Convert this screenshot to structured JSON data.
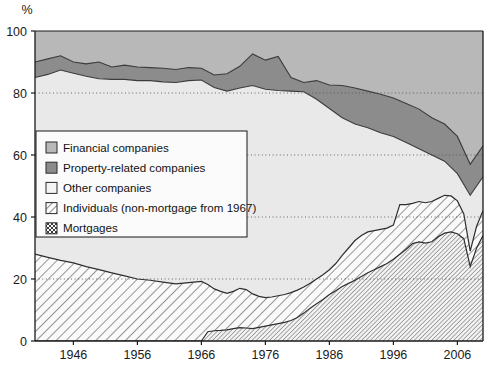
{
  "chart_data": {
    "type": "area",
    "stacked": true,
    "title": "",
    "subtitle": "",
    "xlabel": "",
    "ylabel": "%",
    "ylim": [
      0,
      100
    ],
    "xlim": [
      1940,
      2010
    ],
    "yticks": [
      0,
      20,
      40,
      60,
      80,
      100
    ],
    "ytick_labels": [
      "0",
      "20",
      "40",
      "60",
      "80",
      "100"
    ],
    "xticks": [
      1946,
      1956,
      1966,
      1976,
      1986,
      1996,
      2006
    ],
    "xtick_labels": [
      "1946",
      "1956",
      "1966",
      "1976",
      "1986",
      "1996",
      "2006"
    ],
    "grid": "horizontal dotted at 20, 40, 60, 80",
    "legend_position": "inner left-middle",
    "axis_note": "values are shares of total lending, summing to 100%",
    "series": [
      {
        "name": "Mortgages",
        "swatch": "diagonal-hatch-dense",
        "color": "#f2f2f2",
        "order": 1,
        "x": [
          1940,
          1942,
          1944,
          1946,
          1948,
          1950,
          1952,
          1954,
          1956,
          1958,
          1960,
          1962,
          1964,
          1966,
          1967,
          1968,
          1969,
          1970,
          1971,
          1972,
          1973,
          1974,
          1975,
          1976,
          1977,
          1978,
          1979,
          1980,
          1981,
          1982,
          1983,
          1984,
          1985,
          1986,
          1987,
          1988,
          1989,
          1990,
          1991,
          1992,
          1993,
          1994,
          1995,
          1996,
          1997,
          1998,
          1999,
          2000,
          2001,
          2002,
          2003,
          2004,
          2005,
          2006,
          2007,
          2008,
          2009,
          2010
        ],
        "values": [
          0,
          0,
          0,
          0,
          0,
          0,
          0,
          0,
          0,
          0,
          0,
          0,
          0,
          0,
          3.0,
          3.3,
          3.4,
          3.6,
          4.0,
          4.3,
          4.2,
          4.0,
          4.4,
          4.8,
          5.2,
          5.6,
          6.0,
          6.6,
          7.6,
          9.0,
          10.6,
          12.0,
          13.4,
          15.0,
          16.2,
          17.6,
          18.6,
          19.6,
          20.8,
          22.0,
          23.0,
          24.0,
          25.0,
          26.4,
          28.0,
          29.6,
          31.4,
          32.0,
          31.6,
          32.0,
          33.6,
          34.8,
          35.2,
          34.6,
          33.0,
          24.0,
          30.0,
          34.0
        ]
      },
      {
        "name": "Individuals (non-mortgage from 1967)",
        "swatch": "diagonal-hatch",
        "color": "#fafafa",
        "order": 2,
        "x": [
          1940,
          1942,
          1944,
          1946,
          1948,
          1950,
          1952,
          1954,
          1956,
          1958,
          1960,
          1962,
          1964,
          1966,
          1967,
          1968,
          1969,
          1970,
          1971,
          1972,
          1973,
          1974,
          1975,
          1976,
          1977,
          1978,
          1979,
          1980,
          1981,
          1982,
          1983,
          1984,
          1985,
          1986,
          1987,
          1988,
          1989,
          1990,
          1991,
          1992,
          1993,
          1994,
          1995,
          1996,
          1997,
          1998,
          1999,
          2000,
          2001,
          2002,
          2003,
          2004,
          2005,
          2006,
          2007,
          2008,
          2009,
          2010
        ],
        "values": [
          28.0,
          27.0,
          26.0,
          25.2,
          24.0,
          23.0,
          22.0,
          21.0,
          20.0,
          19.6,
          19.0,
          18.4,
          18.8,
          19.2,
          18.2,
          16.8,
          16.0,
          15.4,
          16.0,
          17.0,
          16.6,
          15.2,
          14.4,
          14.0,
          14.2,
          14.6,
          15.0,
          15.6,
          16.4,
          17.4,
          18.6,
          20.0,
          21.4,
          23.0,
          25.0,
          27.6,
          30.0,
          32.4,
          34.0,
          35.2,
          35.6,
          36.0,
          36.4,
          37.4,
          44.0,
          44.0,
          44.4,
          45.0,
          44.6,
          45.0,
          46.0,
          47.0,
          46.8,
          45.2,
          41.0,
          29.0,
          37.0,
          42.0
        ]
      },
      {
        "name": "Other companies",
        "swatch": "white",
        "color": "#e9e9e9",
        "order": 3,
        "x": [
          1940,
          1942,
          1944,
          1946,
          1948,
          1950,
          1952,
          1954,
          1956,
          1958,
          1960,
          1962,
          1964,
          1966,
          1968,
          1970,
          1972,
          1974,
          1976,
          1978,
          1980,
          1982,
          1984,
          1986,
          1988,
          1990,
          1992,
          1994,
          1996,
          1998,
          2000,
          2002,
          2004,
          2006,
          2008,
          2010
        ],
        "values": [
          85.0,
          86.0,
          87.4,
          86.4,
          85.4,
          84.6,
          84.4,
          84.4,
          84.0,
          84.0,
          83.6,
          83.4,
          84.0,
          84.2,
          81.8,
          80.6,
          81.6,
          82.4,
          81.2,
          80.8,
          80.6,
          80.4,
          78.0,
          75.0,
          72.0,
          70.0,
          68.8,
          67.2,
          66.0,
          64.0,
          62.0,
          60.0,
          58.0,
          54.0,
          47.0,
          53.0
        ]
      },
      {
        "name": "Property-related companies",
        "swatch": "dark-gray",
        "color": "#8c8c8c",
        "order": 4,
        "x": [
          1940,
          1942,
          1944,
          1946,
          1948,
          1950,
          1952,
          1954,
          1956,
          1958,
          1960,
          1962,
          1964,
          1966,
          1968,
          1970,
          1972,
          1974,
          1976,
          1978,
          1980,
          1982,
          1984,
          1986,
          1988,
          1990,
          1992,
          1994,
          1996,
          1998,
          2000,
          2002,
          2004,
          2006,
          2008,
          2010
        ],
        "values": [
          90.0,
          91.0,
          92.0,
          90.0,
          89.4,
          90.0,
          88.4,
          89.0,
          88.4,
          88.2,
          88.0,
          87.6,
          88.2,
          88.0,
          85.8,
          86.2,
          88.6,
          92.6,
          90.6,
          91.8,
          85.0,
          83.4,
          84.0,
          82.6,
          82.4,
          81.6,
          80.6,
          79.6,
          78.4,
          76.6,
          74.8,
          72.0,
          70.0,
          66.0,
          57.0,
          63.0
        ]
      },
      {
        "name": "Financial companies",
        "swatch": "medium-gray",
        "color": "#b8b8b8",
        "order": 5,
        "x": [
          1940,
          2010
        ],
        "values": [
          100,
          100
        ]
      }
    ]
  },
  "axis": {
    "y_unit_label": "%"
  },
  "legend": {
    "items": [
      {
        "label": "Financial companies",
        "swatch": "medium-gray"
      },
      {
        "label": "Property-related companies",
        "swatch": "dark-gray"
      },
      {
        "label": "Other companies",
        "swatch": "white"
      },
      {
        "label": "Individuals (non-mortgage from 1967)",
        "swatch": "diagonal-hatch"
      },
      {
        "label": "Mortgages",
        "swatch": "diagonal-hatch-dense"
      }
    ]
  },
  "colors": {
    "financial": "#b8b8b8",
    "property": "#8c8c8c",
    "other": "#e9e9e9",
    "individuals_bg": "#fafafa",
    "mortgages_bg": "#f2f2f2",
    "axis": "#1a1a1a",
    "grid": "#555555"
  }
}
